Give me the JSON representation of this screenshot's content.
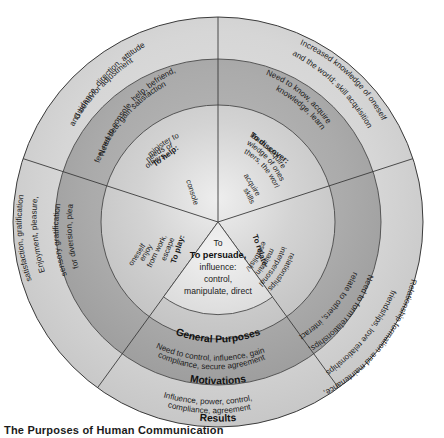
{
  "figure": {
    "title": "The Purposes of Human Communication",
    "ring_labels": {
      "inner": "General Purposes",
      "middle": "Motivations",
      "outer": "Results"
    },
    "center": {
      "bold": "To persuade,",
      "line1": "influence:",
      "line2": "control,",
      "line3": "manipulate, direct"
    },
    "colors": {
      "outer_ring": "#d5d5d5",
      "middle_ring": "#a8a8a8",
      "inner_ring": "#c9c9c9",
      "stroke": "#3b3b3b",
      "text": "#1b1b1b",
      "background": "#ffffff"
    }
  },
  "segments": [
    {
      "id": "help",
      "general_purpose_bold": "To help:",
      "general_purpose": "minister to needs of others, console",
      "motivation": "Need to console, help, befriend, feel needed, gain satisfaction",
      "result": "Guidance, direction, attitude and behavior adjustment"
    },
    {
      "id": "discover",
      "general_purpose_bold": "To discover:",
      "general_purpose": "learn, acquire knowledge of oneself, others, the world, acquire skills",
      "motivation": "Need to know, acquire knowledge, learn",
      "result": "Increased knowledge of oneself and the world; skill acquisition"
    },
    {
      "id": "relate",
      "general_purpose_bold": "To relate:",
      "general_purpose": "establish/maintain interpersonal relationships",
      "motivation": "Need to form relationships, relate to others, interact",
      "result": "Relationship formation and maintenance, friendships, love relationships"
    },
    {
      "id": "persuade",
      "general_purpose_bold": "To persuade,",
      "general_purpose": "influence: control, manipulate, direct",
      "motivation": "Need to control, influence, gain compliance, secure agreement",
      "result": "Influence, power, control, compliance, agreement"
    },
    {
      "id": "play",
      "general_purpose_bold": "To play:",
      "general_purpose": "escape from work, enjoy oneself",
      "motivation": "Need for diversion, pleasure, sensory gratification",
      "result": "Enjoyment, pleasure, satisfaction, gratification"
    }
  ],
  "text_fragments": {
    "help_gp_l1": "minister to",
    "help_gp_l2": "needs of",
    "help_gp_l3": "others,",
    "help_gp_l4": "console",
    "help_mot_l1": "Need to console, help, befriend,",
    "help_mot_l2": "feel needed, gain satisfaction",
    "help_res_l1": "Guidance, direction, attitude",
    "help_res_l2": "and behavior adjustment",
    "discover_gp_l1": "learn, acquire",
    "discover_gp_l2": "knowledge of oneself,",
    "discover_gp_l3": "others, the world,",
    "discover_gp_l4": "acquire",
    "discover_gp_l5": "skills",
    "discover_mot_l1": "Need to know, acquire",
    "discover_mot_l2": "knowledge, learn",
    "discover_res_l1": "Increased knowledge of oneself",
    "discover_res_l2": "and the world; skill acquisition",
    "relate_gp_l1": "establish/",
    "relate_gp_l2": "maintain",
    "relate_gp_l3": "interpersonal",
    "relate_gp_l4": "relationships",
    "relate_mot_l1": "Need to form relationships,",
    "relate_mot_l2": "relate to others, interact",
    "relate_res_l1": "Relationship formation and maintenance,",
    "relate_res_l2": "friendships, love relationships",
    "persuade_mot_l1": "Need to control, influence, gain",
    "persuade_mot_l2": "compliance, secure agreement",
    "persuade_res_l1": "Influence, power, control,",
    "persuade_res_l2": "compliance, agreement",
    "play_gp_l1": "escape",
    "play_gp_l2": "from work,",
    "play_gp_l3": "enjoy",
    "play_gp_l4": "oneself",
    "play_mot_l1": "Need for diversion, pleasure,",
    "play_mot_l2": "sensory gratification",
    "play_res_l1": "Enjoyment, pleasure,",
    "play_res_l2": "satisfaction, gratification"
  }
}
